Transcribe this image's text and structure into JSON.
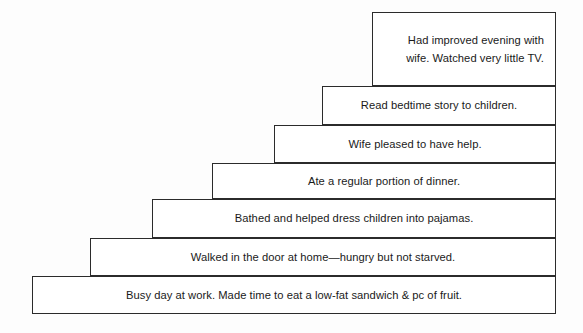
{
  "diagram": {
    "type": "ascending-staircase-flow",
    "background_color": "#fdfdfd",
    "border_color": "#2b2b2b",
    "box_fill_color": "#ffffff",
    "text_color": "#1a1a1a",
    "steps": [
      {
        "index": 1,
        "position": "top",
        "text": "Had improved evening with wife.  Watched very little TV.",
        "align": "right",
        "x": 372,
        "y": 12,
        "width": 184,
        "height": 74
      },
      {
        "index": 2,
        "position": "second",
        "text": "Read bedtime story to children.",
        "align": "center",
        "x": 322,
        "y": 86,
        "width": 234,
        "height": 39
      },
      {
        "index": 3,
        "position": "third",
        "text": "Wife pleased to have help.",
        "align": "center",
        "x": 274,
        "y": 125,
        "width": 282,
        "height": 38
      },
      {
        "index": 4,
        "position": "fourth",
        "text": "Ate a regular portion of dinner.",
        "align": "center",
        "x": 212,
        "y": 163,
        "width": 344,
        "height": 36
      },
      {
        "index": 5,
        "position": "fifth",
        "text": "Bathed and helped dress children into pajamas.",
        "align": "center",
        "x": 152,
        "y": 199,
        "width": 404,
        "height": 39
      },
      {
        "index": 6,
        "position": "sixth",
        "text": "Walked in the door at home—hungry but not starved.",
        "align": "center",
        "x": 90,
        "y": 238,
        "width": 466,
        "height": 38
      },
      {
        "index": 7,
        "position": "bottom",
        "text": "Busy day at work.  Made time to eat a low-fat sandwich & pc of fruit.",
        "align": "center",
        "x": 32,
        "y": 276,
        "width": 524,
        "height": 38
      }
    ]
  }
}
